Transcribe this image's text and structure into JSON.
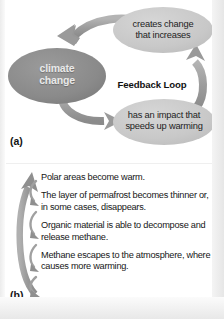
{
  "figure": {
    "panel_a": {
      "label": "(a)",
      "center_label": "Feedback Loop",
      "nodes": [
        {
          "id": "climate-change",
          "text": "climate\nchange",
          "fill": "#8c8c8c",
          "text_color": "#e9e9e9"
        },
        {
          "id": "creates-change",
          "text": "creates change\nthat increases",
          "fill": "#c9c9c9",
          "text_color": "#1d1d1d"
        },
        {
          "id": "has-impact",
          "text": "has an impact that\nspeeds up warming",
          "fill": "#c9c9c9",
          "text_color": "#1d1d1d"
        }
      ],
      "arrows": [
        {
          "id": "arrow-creates-to-climate",
          "from": "creates-change",
          "to": "climate-change",
          "direction": "down-left"
        },
        {
          "id": "arrow-climate-to-impact",
          "from": "climate-change",
          "to": "has-impact",
          "direction": "right"
        },
        {
          "id": "arrow-impact-to-creates",
          "from": "has-impact",
          "to": "creates-change",
          "direction": "up"
        }
      ]
    },
    "panel_b": {
      "label": "(b)",
      "steps": [
        "Polar areas become warm.",
        "The layer of permafrost becomes thinner or, in some cases, disappears.",
        "Organic material is able to decompose and release methane.",
        "Methane escapes to the atmosphere, where it causes more warming."
      ],
      "arrows": [
        {
          "id": "arrow-feedback-return",
          "direction": "up",
          "style": "large-curved"
        },
        {
          "id": "arrow-step-1-to-2",
          "direction": "down",
          "style": "small-hook"
        },
        {
          "id": "arrow-step-2-to-3",
          "direction": "down",
          "style": "small-hook"
        },
        {
          "id": "arrow-step-3-to-4",
          "direction": "down",
          "style": "small-hook"
        }
      ]
    }
  },
  "colors": {
    "node_dark": "#8c8c8c",
    "node_light": "#c9c9c9",
    "arrow": "#9a9a9a",
    "arrow_dark": "#8a8a8a",
    "background": "#ffffff",
    "text": "#161616"
  }
}
